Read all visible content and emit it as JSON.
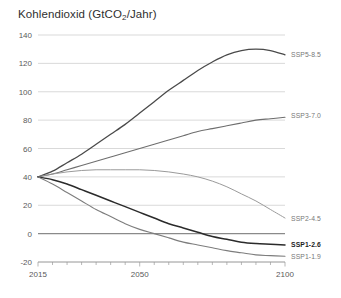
{
  "chart_data": {
    "type": "line",
    "title": "Kohlendioxid (GtCO2/Jahr)",
    "title_main": "Kohlendioxid (GtCO",
    "title_sub": "2",
    "title_tail": "/Jahr)",
    "xlabel": "",
    "ylabel": "",
    "xlim": [
      2015,
      2100
    ],
    "ylim": [
      -20,
      140
    ],
    "grid": true,
    "legend_position": "right-inline",
    "x_ticks": [
      2015,
      2050,
      2100
    ],
    "x_tick_labels": [
      "2015",
      "2050",
      "2100"
    ],
    "x_minor_tick_step": 5,
    "y_ticks": [
      -20,
      0,
      20,
      40,
      60,
      80,
      100,
      120,
      140
    ],
    "y_tick_labels": [
      "-20",
      "0",
      "20",
      "40",
      "60",
      "80",
      "100",
      "120",
      "140"
    ],
    "x": [
      2015,
      2020,
      2025,
      2030,
      2035,
      2040,
      2045,
      2050,
      2055,
      2060,
      2065,
      2070,
      2075,
      2080,
      2085,
      2090,
      2095,
      2100
    ],
    "series": [
      {
        "name": "SSP5-8.5",
        "label": "SSP5-8.5",
        "color": "#4a4a4a",
        "width": 1.3,
        "emphasis": false,
        "label_value": 126,
        "values": [
          40,
          44,
          50,
          56,
          63,
          70,
          77,
          85,
          93,
          101,
          108,
          115,
          121,
          126,
          129,
          130,
          129,
          126
        ]
      },
      {
        "name": "SSP3-7.0",
        "label": "SSP3-7.0",
        "color": "#6e6e6e",
        "width": 1.1,
        "emphasis": false,
        "label_value": 83,
        "values": [
          40,
          42,
          45,
          48,
          51,
          54,
          57,
          60,
          63,
          66,
          69,
          72,
          74,
          76,
          78,
          80,
          81,
          82
        ]
      },
      {
        "name": "SSP2-4.5",
        "label": "SSP2-4.5",
        "color": "#9a9a9a",
        "width": 1.0,
        "emphasis": false,
        "label_value": 11,
        "values": [
          40,
          42,
          43.5,
          44.5,
          45,
          45,
          45,
          45,
          44.5,
          43.5,
          42,
          40,
          37,
          33,
          28,
          23,
          17,
          11
        ]
      },
      {
        "name": "SSP1-2.6",
        "label": "SSP1-2.6",
        "color": "#2b2b2b",
        "width": 1.5,
        "emphasis": true,
        "label_value": -8,
        "values": [
          40,
          38,
          35,
          31,
          27,
          23,
          19,
          15,
          11,
          7,
          4,
          1,
          -2,
          -4,
          -6,
          -7,
          -7.5,
          -8
        ]
      },
      {
        "name": "SSP1-1.9",
        "label": "SSP1-1.9",
        "color": "#7d7d7d",
        "width": 1.1,
        "emphasis": false,
        "label_value": -16,
        "values": [
          40,
          35,
          29,
          23,
          17,
          12,
          7,
          3,
          0,
          -3,
          -6,
          -8,
          -10,
          -12,
          -13.5,
          -15,
          -15.5,
          -16
        ]
      }
    ]
  }
}
